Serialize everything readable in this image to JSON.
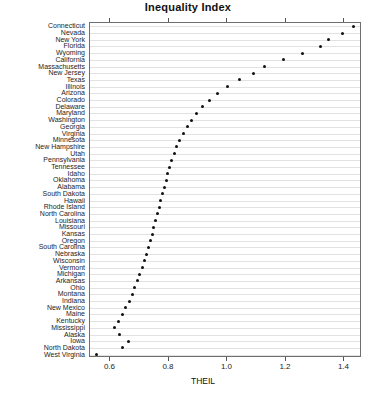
{
  "chart_data": {
    "type": "scatter",
    "title": "Inequality Index",
    "xlabel": "THEIL",
    "ylabel": "",
    "orientation": "horizontal-dotplot",
    "grid": true,
    "legend": "none",
    "xlim": [
      0.53,
      1.46
    ],
    "xticks": [
      0.6,
      0.8,
      1.0,
      1.2,
      1.4
    ],
    "xticklabels": [
      "0.6",
      "0.8",
      "1.0",
      "1.2",
      "1.4"
    ],
    "categories": [
      "Connecticut",
      "Nevada",
      "New York",
      "Florida",
      "Wyoming",
      "California",
      "Massachusetts",
      "New Jersey",
      "Texas",
      "Illinois",
      "Arizona",
      "Colorado",
      "Delaware",
      "Maryland",
      "Washington",
      "Georgia",
      "Virginia",
      "Minnesota",
      "New Hampshire",
      "Utah",
      "Pennsylvania",
      "Tennessee",
      "Idaho",
      "Oklahoma",
      "Alabama",
      "South Dakota",
      "Hawaii",
      "Rhode Island",
      "North Carolina",
      "Louisiana",
      "Missouri",
      "Kansas",
      "Oregon",
      "South Carolina",
      "Nebraska",
      "Wisconsin",
      "Vermont",
      "Michigan",
      "Arkansas",
      "Ohio",
      "Montana",
      "Indiana",
      "New Mexico",
      "Maine",
      "Kentucky",
      "Mississippi",
      "Alaska",
      "Iowa",
      "North Dakota",
      "West Virginia"
    ],
    "values": [
      1.43,
      1.395,
      1.345,
      1.318,
      1.255,
      1.19,
      1.128,
      1.09,
      1.04,
      1.0,
      0.965,
      0.938,
      0.915,
      0.895,
      0.878,
      0.862,
      0.848,
      0.836,
      0.826,
      0.818,
      0.81,
      0.803,
      0.796,
      0.79,
      0.784,
      0.778,
      0.772,
      0.766,
      0.76,
      0.754,
      0.748,
      0.742,
      0.736,
      0.729,
      0.722,
      0.715,
      0.708,
      0.7,
      0.692,
      0.683,
      0.674,
      0.664,
      0.653,
      0.641,
      0.628,
      0.613,
      0.63,
      0.66,
      0.64,
      0.553
    ]
  },
  "axes": {
    "x_title": "THEIL"
  }
}
